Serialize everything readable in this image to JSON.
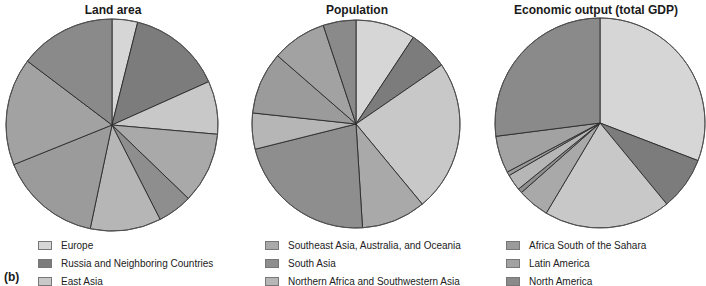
{
  "figure_label": "(b)",
  "chart_data": [
    {
      "type": "pie",
      "title": "Land area",
      "categories": [
        "Europe",
        "Russia and Neighboring Countries",
        "East Asia",
        "Southeast Asia, Australia, and Oceania",
        "South Asia",
        "Northern Africa and Southwestern Asia",
        "Africa South of the Sahara",
        "Latin America",
        "North America"
      ],
      "values": [
        3.9,
        14.4,
        8.1,
        10.8,
        5.3,
        10.8,
        15.6,
        16.4,
        14.7
      ],
      "unit": "percent (estimated from slice angles)",
      "start_angle": "12 o'clock, clockwise"
    },
    {
      "type": "pie",
      "title": "Population",
      "categories": [
        "Europe",
        "Russia and Neighboring Countries",
        "East Asia",
        "Southeast Asia, Australia, and Oceania",
        "South Asia",
        "Northern Africa and Southwestern Asia",
        "Africa South of the Sahara",
        "Latin America",
        "North America"
      ],
      "values": [
        9.3,
        6.1,
        23.6,
        10.0,
        22.1,
        5.6,
        9.7,
        8.5,
        5.1
      ],
      "unit": "percent (estimated from slice angles)",
      "start_angle": "12 o'clock, clockwise"
    },
    {
      "type": "pie",
      "title": "Economic output (total GDP)",
      "categories": [
        "Europe",
        "Russia and Neighboring Countries",
        "East Asia",
        "Southeast Asia, Australia, and Oceania",
        "South Asia",
        "Northern Africa and Southwestern Asia",
        "Africa South of the Sahara",
        "Latin America",
        "North America"
      ],
      "values": [
        30.8,
        8.2,
        19.5,
        4.9,
        0.7,
        2.5,
        0.6,
        5.7,
        27.0
      ],
      "unit": "percent (estimated from slice angles)",
      "start_angle": "12 o'clock, clockwise"
    }
  ],
  "legend": {
    "columns": [
      [
        {
          "label": "Europe",
          "color": "#d6d6d6"
        },
        {
          "label": "Russia and Neighboring Countries",
          "color": "#7c7c7c"
        },
        {
          "label": "East Asia",
          "color": "#c8c8c8"
        }
      ],
      [
        {
          "label": "Southeast Asia, Australia, and Oceania",
          "color": "#a9a9a9"
        },
        {
          "label": "South Asia",
          "color": "#8e8e8e"
        },
        {
          "label": "Northern Africa and Southwestern Asia",
          "color": "#b6b6b6"
        }
      ],
      [
        {
          "label": "Africa South of the Sahara",
          "color": "#9b9b9b"
        },
        {
          "label": "Latin America",
          "color": "#a2a2a2"
        },
        {
          "label": "North America",
          "color": "#8a8a8a"
        }
      ]
    ]
  },
  "colors": [
    "#d6d6d6",
    "#7c7c7c",
    "#c8c8c8",
    "#a9a9a9",
    "#8e8e8e",
    "#b6b6b6",
    "#9b9b9b",
    "#a2a2a2",
    "#8a8a8a"
  ]
}
